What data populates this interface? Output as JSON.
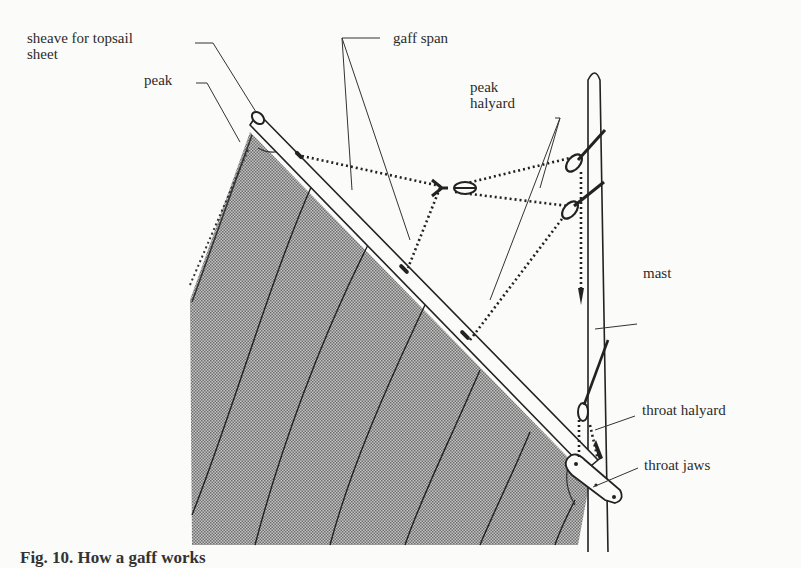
{
  "figure": {
    "caption": "Fig. 10. How a gaff works",
    "colors": {
      "background": "#fbfbf9",
      "ink": "#2a2a2a",
      "sail_fill": "#a9a9a9"
    }
  },
  "labels": {
    "sheave_line1": "sheave for topsail",
    "sheave_line2": "sheet",
    "peak": "peak",
    "gaff_span": "gaff span",
    "peak_halyard_line1": "peak",
    "peak_halyard_line2": "halyard",
    "mast": "mast",
    "throat_halyard": "throat halyard",
    "throat_jaws": "throat jaws"
  }
}
